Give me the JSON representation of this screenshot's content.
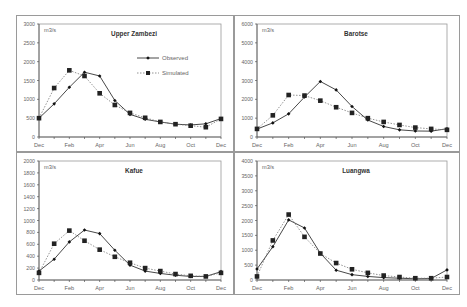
{
  "legend": {
    "observed": "Observed",
    "simulated": "Simulated"
  },
  "unit_label": "m3/s",
  "chart_data": [
    {
      "type": "line",
      "title": "Upper Zambezi",
      "ylabel": "m3/s",
      "xlabel": "",
      "x_tick_labels": [
        "Dec",
        "",
        "Feb",
        "",
        "Apr",
        "",
        "Jun",
        "",
        "Aug",
        "",
        "Oct",
        "",
        "Dec"
      ],
      "ylim": [
        0,
        3000
      ],
      "yticks": [
        0,
        500,
        1000,
        1500,
        2000,
        2500,
        3000
      ],
      "legend_position": "upper right",
      "grid": false,
      "series": [
        {
          "name": "Observed",
          "style": "solid-diamond",
          "values": [
            500,
            880,
            1320,
            1720,
            1620,
            970,
            600,
            470,
            400,
            340,
            320,
            350,
            490
          ]
        },
        {
          "name": "Simulated",
          "style": "dotted-square",
          "values": [
            500,
            1300,
            1770,
            1620,
            1160,
            850,
            640,
            510,
            400,
            340,
            300,
            260,
            480
          ]
        }
      ]
    },
    {
      "type": "line",
      "title": "Barotse",
      "ylabel": "m3/s",
      "xlabel": "",
      "x_tick_labels": [
        "Dec",
        "",
        "Feb",
        "",
        "Apr",
        "",
        "Jun",
        "",
        "Aug",
        "",
        "Oct",
        "",
        "Dec"
      ],
      "ylim": [
        0,
        6000
      ],
      "yticks": [
        0,
        1000,
        2000,
        3000,
        4000,
        5000,
        6000
      ],
      "grid": false,
      "series": [
        {
          "name": "Observed",
          "style": "solid-diamond",
          "values": [
            420,
            750,
            1230,
            2120,
            2950,
            2500,
            1620,
            900,
            560,
            380,
            320,
            310,
            440
          ]
        },
        {
          "name": "Simulated",
          "style": "dotted-square",
          "values": [
            430,
            1150,
            2230,
            2200,
            1930,
            1580,
            1280,
            1000,
            800,
            640,
            500,
            430,
            380
          ]
        }
      ]
    },
    {
      "type": "line",
      "title": "Kafue",
      "ylabel": "m3/s",
      "xlabel": "",
      "x_tick_labels": [
        "Dec",
        "",
        "Feb",
        "",
        "Apr",
        "",
        "Jun",
        "",
        "Aug",
        "",
        "Oct",
        "",
        "Dec"
      ],
      "ylim": [
        0,
        2000
      ],
      "yticks": [
        0,
        200,
        400,
        600,
        800,
        1000,
        1200,
        1400,
        1600,
        1800,
        2000
      ],
      "grid": false,
      "series": [
        {
          "name": "Observed",
          "style": "solid-diamond",
          "values": [
            150,
            350,
            640,
            840,
            780,
            500,
            250,
            150,
            110,
            80,
            60,
            60,
            140
          ]
        },
        {
          "name": "Simulated",
          "style": "dotted-square",
          "values": [
            120,
            610,
            830,
            660,
            510,
            390,
            290,
            200,
            150,
            100,
            70,
            60,
            120
          ]
        }
      ]
    },
    {
      "type": "line",
      "title": "Luangwa",
      "ylabel": "m3/s",
      "xlabel": "",
      "x_tick_labels": [
        "Dec",
        "",
        "Feb",
        "",
        "Apr",
        "",
        "Jun",
        "",
        "Aug",
        "",
        "Oct",
        "",
        "Dec"
      ],
      "ylim": [
        0,
        4000
      ],
      "yticks": [
        0,
        500,
        1000,
        1500,
        2000,
        2500,
        3000,
        3500,
        4000
      ],
      "grid": false,
      "series": [
        {
          "name": "Observed",
          "style": "solid-diamond",
          "values": [
            370,
            1120,
            2020,
            1750,
            900,
            330,
            180,
            120,
            80,
            60,
            40,
            50,
            340
          ]
        },
        {
          "name": "Simulated",
          "style": "dotted-square",
          "values": [
            120,
            1330,
            2200,
            1450,
            890,
            570,
            360,
            240,
            150,
            100,
            60,
            60,
            100
          ]
        }
      ]
    }
  ]
}
